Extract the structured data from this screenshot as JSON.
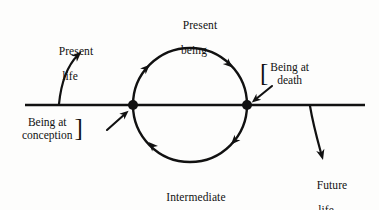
{
  "figure": {
    "background_color": "#fdfdfc",
    "ink_color": "#111111"
  },
  "labels": {
    "present_being": {
      "line1": "Present",
      "line2": "being"
    },
    "present_life": {
      "line1": "Present",
      "line2": "life"
    },
    "intermediate_being": {
      "line1": "Intermediate",
      "line2": "being"
    },
    "future_life": {
      "line1": "Future",
      "line2": "life"
    },
    "being_at_conception": {
      "line1": "Being at",
      "line2": "conception",
      "bracket": "]"
    },
    "being_at_death": {
      "line1": "Being at",
      "line2": "death",
      "bracket": "["
    }
  },
  "diagram": {
    "timeline": {
      "name": "horizontal timeline",
      "x_start": 25,
      "x_end": 365,
      "y": 105
    },
    "circle": {
      "name": "cycle of rebirth",
      "cx": 190,
      "cy": 105,
      "r": 57,
      "direction": "clockwise"
    },
    "nodes": [
      {
        "name": "conception-point",
        "x": 133,
        "y": 105
      },
      {
        "name": "death-point",
        "x": 247,
        "y": 105
      }
    ],
    "circle_arrowheads": [
      {
        "name": "arrowhead-upper-left",
        "x": 147,
        "y": 74
      },
      {
        "name": "arrowhead-upper-right",
        "x": 234,
        "y": 74
      },
      {
        "name": "arrowhead-lower-left",
        "x": 147,
        "y": 136
      },
      {
        "name": "arrowhead-lower-right",
        "x": 234,
        "y": 136
      }
    ],
    "pointer_arrows": [
      {
        "name": "conception-pointer",
        "from_x": 108,
        "from_y": 128,
        "to_x": 129,
        "to_y": 110
      },
      {
        "name": "death-pointer",
        "from_x": 270,
        "from_y": 88,
        "to_x": 251,
        "to_y": 103
      }
    ],
    "curved_arrows": [
      {
        "name": "present-life-arrow",
        "start_x": 60,
        "start_y": 104,
        "end_x": 81,
        "end_y": 50
      },
      {
        "name": "future-life-arrow",
        "start_x": 310,
        "start_y": 106,
        "end_x": 323,
        "end_y": 160
      }
    ]
  }
}
